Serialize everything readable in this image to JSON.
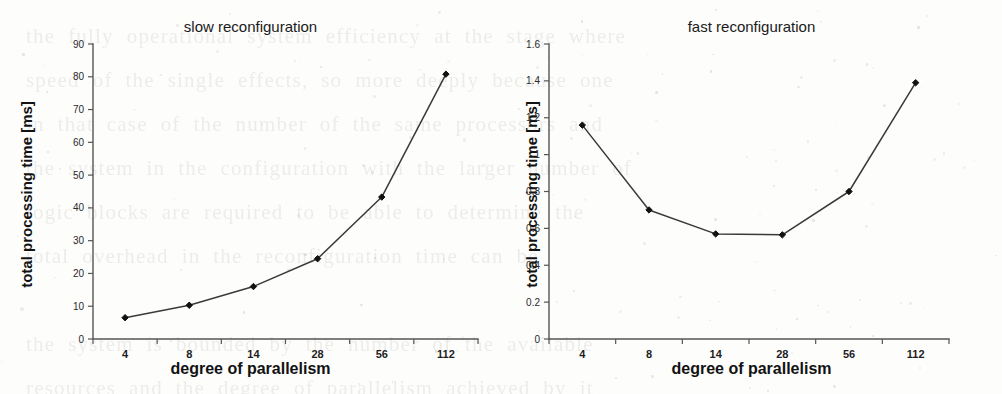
{
  "page": {
    "width": 1002,
    "height": 394,
    "background_color": "#fdfdfc",
    "ink_color": "#1c1c1c",
    "line_color": "#3a3a3a",
    "axis_color": "#555555"
  },
  "bleed_text": "the  fully  operational  system  efficiency  at  the  stage  where\nspeed  of  the  single  effects,  so  more  deeply  because  one\nin  that  case  of  the  number  of  the  same  processors  and\nthe  system  in  the  configuration  with  the  larger  number  of\nlogic  blocks  are  required  to  be  able  to  determine  the\ntotal  overhead  in  the  reconfiguration  time  can  be\n\nthe  system  is  bounded  by  the  number  of  the  available\nresources  and  the  degree  of  parallelism  achieved  by  it\n\nFigure  shows  the  total  processing  time  for  the  two\nvariants:  slow  and  fast  reconfiguration  mode.",
  "chart_data": [
    {
      "id": "slow-reconfiguration",
      "type": "line",
      "title": "slow reconfiguration",
      "xlabel": "degree of parallelism",
      "ylabel": "total processing time [ms]",
      "categories": [
        "4",
        "8",
        "14",
        "28",
        "56",
        "112"
      ],
      "values": [
        6.5,
        10.3,
        16.0,
        24.5,
        43.3,
        80.8
      ],
      "ylim": [
        0,
        90
      ],
      "yticks": [
        "0",
        "10",
        "20",
        "30",
        "40",
        "50",
        "60",
        "70",
        "80",
        "90"
      ],
      "ytick_values": [
        0,
        10,
        20,
        30,
        40,
        50,
        60,
        70,
        80,
        90
      ],
      "grid": false,
      "legend": "none",
      "marker": "filled-diamond"
    },
    {
      "id": "fast-reconfiguration",
      "type": "line",
      "title": "fast reconfiguration",
      "xlabel": "degree of parallelism",
      "ylabel": "total processing time [ms]",
      "categories": [
        "4",
        "8",
        "14",
        "28",
        "56",
        "112"
      ],
      "values": [
        1.16,
        0.7,
        0.57,
        0.565,
        0.8,
        1.39
      ],
      "ylim": [
        0,
        1.6
      ],
      "yticks": [
        "0",
        "0.2",
        "0.4",
        "0.6",
        "0.8",
        "1",
        "1.2",
        "1.4",
        "1.6"
      ],
      "ytick_values": [
        0,
        0.2,
        0.4,
        0.6,
        0.8,
        1.0,
        1.2,
        1.4,
        1.6
      ],
      "grid": false,
      "legend": "none",
      "marker": "filled-diamond"
    }
  ]
}
